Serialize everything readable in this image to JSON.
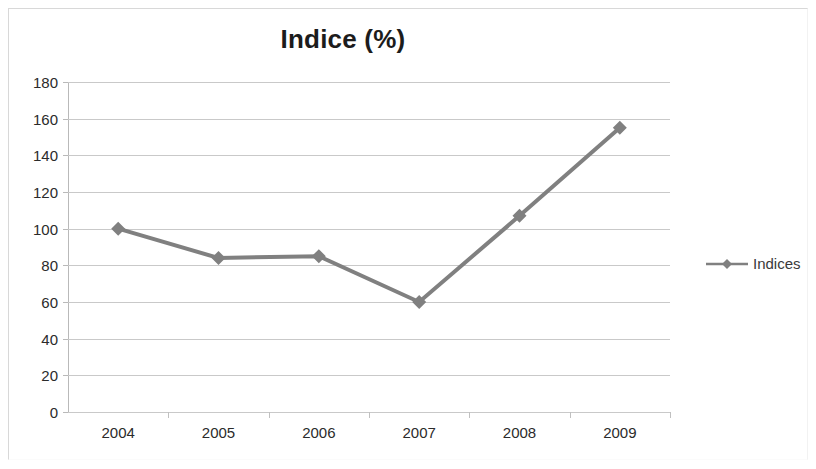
{
  "chart_data": {
    "type": "line",
    "title": "Indice (%)",
    "xlabel": "",
    "ylabel": "",
    "categories": [
      "2004",
      "2005",
      "2006",
      "2007",
      "2008",
      "2009"
    ],
    "series": [
      {
        "name": "Indices",
        "values": [
          100,
          84,
          85,
          60,
          107,
          155
        ],
        "color": "#808080",
        "marker": "diamond"
      }
    ],
    "ylim": [
      0,
      180
    ],
    "ytick_labels": [
      "180",
      "160",
      "140",
      "120",
      "100",
      "80",
      "60",
      "40",
      "20",
      "0"
    ],
    "ytick_values": [
      180,
      160,
      140,
      120,
      100,
      80,
      60,
      40,
      20,
      0
    ],
    "grid": true,
    "grid_color": "#c9c9c9",
    "legend_position": "right"
  },
  "legend": {
    "entries": [
      {
        "label": "Indices",
        "color": "#808080"
      }
    ]
  }
}
